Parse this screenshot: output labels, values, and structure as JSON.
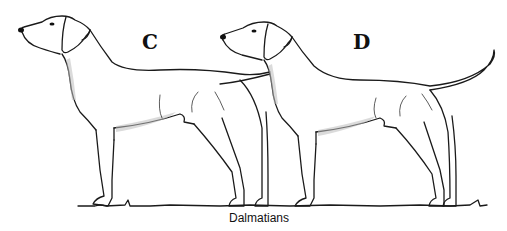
{
  "figure": {
    "labels": {
      "left": "C",
      "right": "D"
    },
    "caption": "Dalmatians",
    "line_color": "#1a1a1a",
    "background": "#ffffff"
  }
}
